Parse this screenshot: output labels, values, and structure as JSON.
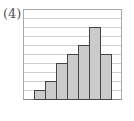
{
  "figure": {
    "label": "(4)"
  },
  "chart_data": {
    "type": "bar",
    "title": "",
    "xlabel": "",
    "ylabel": "",
    "categories": [
      "1",
      "2",
      "3",
      "4",
      "5",
      "6",
      "7"
    ],
    "values": [
      1,
      2,
      4,
      5,
      6,
      8,
      5
    ],
    "ylim": [
      0,
      10
    ],
    "grid": true,
    "gridlines_count": 10,
    "bar_style": "histogram (adjacent bars, no gaps)",
    "legend": null,
    "colors": {
      "bar_fill": "#cbcbcb",
      "bar_edge": "#444444",
      "grid": "#cfcfcf",
      "frame": "#a8a8a8"
    }
  }
}
